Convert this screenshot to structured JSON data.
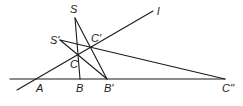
{
  "diagram": {
    "type": "projective-geometry-construction",
    "labels": {
      "S": "S",
      "S_prime": "S'",
      "l": "l",
      "C_prime": "C'",
      "C": "C",
      "A": "A",
      "B": "B",
      "B_prime": "B'",
      "C_double_prime": "C''"
    },
    "points": {
      "S": [
        75,
        18
      ],
      "S_prime": [
        60,
        40
      ],
      "l_end": [
        153,
        11
      ],
      "l_start": [
        17,
        90
      ],
      "C_prime": [
        91,
        47
      ],
      "C": [
        78,
        54
      ],
      "A": [
        37,
        79
      ],
      "B": [
        80,
        79
      ],
      "B_prime": [
        107,
        79
      ],
      "C_double_prime": [
        225,
        79
      ],
      "baseline_start": [
        10,
        79
      ]
    },
    "line_color": "#1a1a1a"
  }
}
